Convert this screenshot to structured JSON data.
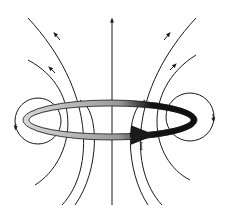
{
  "diagram": {
    "current_label": "I",
    "colors": {
      "line": "#1a1a1a",
      "loop_dark": "#111111",
      "loop_light": "#bdbdbd",
      "background": "#ffffff"
    }
  }
}
